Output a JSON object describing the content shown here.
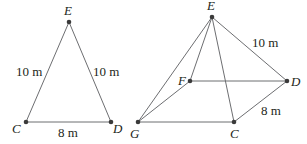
{
  "figures": {
    "triangle": {
      "points": {
        "E": "E",
        "C": "C",
        "D": "D"
      },
      "labels": {
        "left": "10 m",
        "right": "10 m",
        "base": "8 m"
      }
    },
    "pyramid": {
      "points": {
        "E": "E",
        "F": "F",
        "D": "D",
        "C": "C",
        "G": "G"
      },
      "labels": {
        "edge": "10 m",
        "base": "8 m"
      }
    }
  },
  "colors": {
    "line": "#6d6e71",
    "point": "#3a3a3a",
    "text": "#231f20"
  }
}
